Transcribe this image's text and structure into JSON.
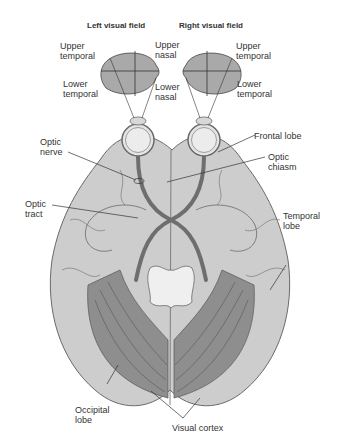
{
  "diagram": {
    "type": "anatomical-illustration",
    "colors": {
      "background": "#ffffff",
      "brain_fill": "#cdcdcd",
      "brain_outline": "#6a6a6a",
      "visual_field_fill": "#a9a9a9",
      "pathway_fill": "#7a7a7a",
      "visual_cortex_fill": "#8e8e8e",
      "eye_fill": "#e6e6e6",
      "label_text": "#333333"
    }
  },
  "headers": {
    "left_field": "Left visual field",
    "right_field": "Right visual field"
  },
  "labels": {
    "upper_temporal_left": "Upper\ntemporal",
    "lower_temporal_left": "Lower\ntemporal",
    "upper_nasal": "Upper\nnasal",
    "lower_nasal": "Lower\nnasal",
    "upper_temporal_right": "Upper\ntemporal",
    "lower_temporal_right": "Lower\ntemporal",
    "optic_nerve": "Optic\nnerve",
    "frontal_lobe": "Frontal lobe",
    "optic_chiasm": "Optic\nchiasm",
    "optic_tract": "Optic\ntract",
    "temporal_lobe": "Temporal\nlobe",
    "occipital_lobe": "Occipital\nlobe",
    "visual_cortex": "Visual cortex"
  }
}
